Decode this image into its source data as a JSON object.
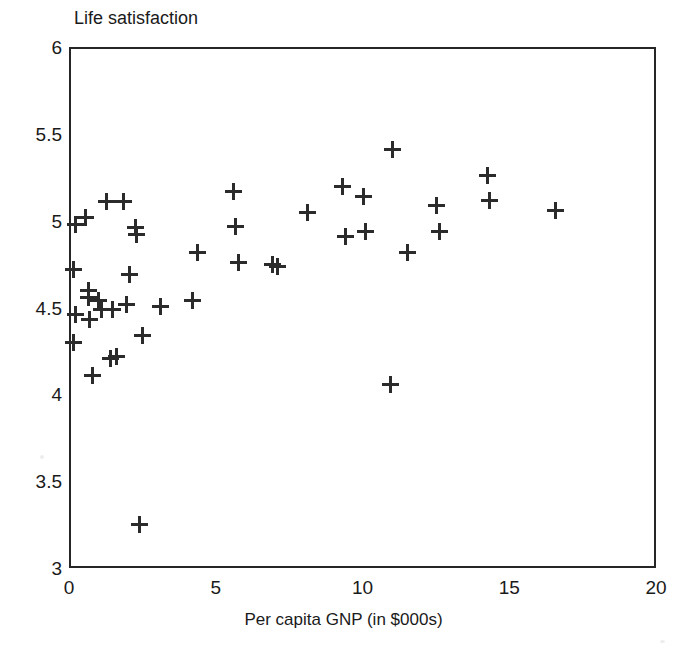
{
  "chart_data": {
    "type": "scatter",
    "title": "",
    "ylabel": "Life satisfaction",
    "xlabel": "Per capita GNP (in $000s)",
    "xlim": [
      0,
      20
    ],
    "ylim": [
      3,
      6
    ],
    "xticks": [
      "0",
      "5",
      "10",
      "15",
      "20"
    ],
    "xtick_values": [
      0,
      5,
      10,
      15,
      20
    ],
    "yticks": [
      "3",
      "3.5",
      "4",
      "4.5",
      "5",
      "5.5",
      "6"
    ],
    "ytick_values": [
      3,
      3.5,
      4,
      4.5,
      5,
      5.5,
      6
    ],
    "grid": false,
    "legend": false,
    "marker": "plus",
    "marker_color": "#2b2b2b",
    "frame_color": "#262626",
    "background": "#ffffff",
    "n_points": 43,
    "points": [
      [
        0.07,
        4.31
      ],
      [
        0.1,
        4.73
      ],
      [
        0.14,
        4.47
      ],
      [
        0.17,
        4.99
      ],
      [
        0.48,
        5.03
      ],
      [
        0.58,
        4.61
      ],
      [
        0.6,
        4.57
      ],
      [
        0.62,
        4.44
      ],
      [
        0.72,
        4.12
      ],
      [
        1.05,
        4.5
      ],
      [
        1.2,
        5.12
      ],
      [
        1.35,
        4.22
      ],
      [
        1.55,
        4.23
      ],
      [
        1.78,
        5.12
      ],
      [
        1.9,
        4.53
      ],
      [
        2.0,
        4.7
      ],
      [
        2.2,
        4.97
      ],
      [
        2.22,
        4.93
      ],
      [
        2.45,
        4.35
      ],
      [
        4.15,
        4.55
      ],
      [
        4.3,
        4.83
      ],
      [
        5.55,
        5.18
      ],
      [
        5.62,
        4.98
      ],
      [
        5.7,
        4.77
      ],
      [
        6.85,
        4.76
      ],
      [
        8.05,
        5.06
      ],
      [
        9.25,
        5.21
      ],
      [
        9.35,
        4.92
      ],
      [
        9.95,
        5.15
      ],
      [
        10.05,
        4.95
      ],
      [
        10.95,
        5.42
      ],
      [
        10.9,
        4.07
      ],
      [
        11.45,
        4.83
      ],
      [
        12.45,
        5.1
      ],
      [
        12.55,
        4.95
      ],
      [
        14.2,
        5.27
      ],
      [
        14.25,
        5.13
      ],
      [
        16.5,
        5.07
      ],
      [
        2.35,
        3.26
      ],
      [
        0.95,
        4.55
      ],
      [
        1.42,
        4.5
      ],
      [
        3.05,
        4.52
      ],
      [
        7.05,
        4.75
      ]
    ]
  },
  "axes": {
    "y_axis_title": "Life satisfaction",
    "x_axis_title": "Per capita GNP (in $000s)"
  }
}
